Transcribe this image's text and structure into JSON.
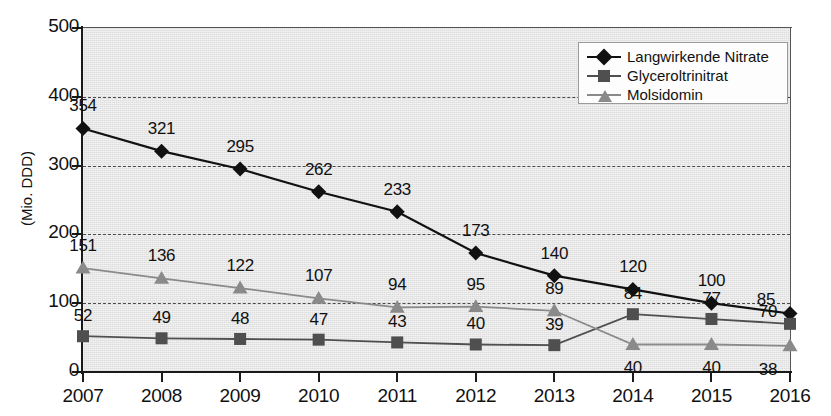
{
  "chart_data": {
    "type": "line",
    "title": "",
    "xlabel": "",
    "ylabel": "(Mio. DDD)",
    "x": [
      "2007",
      "2008",
      "2009",
      "2010",
      "2011",
      "2012",
      "2013",
      "2014",
      "2015",
      "2016"
    ],
    "categories": [
      "2007",
      "2008",
      "2009",
      "2010",
      "2011",
      "2012",
      "2013",
      "2014",
      "2015",
      "2016"
    ],
    "ylim": [
      0,
      500
    ],
    "yticks": [
      0,
      100,
      200,
      300,
      400,
      500
    ],
    "ytick_labels": [
      "0",
      "100",
      "200",
      "300",
      "400",
      "500"
    ],
    "grid": "horizontal-dashed",
    "legend_position": "top-right",
    "series": [
      {
        "name": "Langwirkende Nitrate",
        "marker": "diamond",
        "color": "#111111",
        "values": [
          354,
          321,
          295,
          262,
          233,
          173,
          140,
          120,
          100,
          85
        ],
        "labels": [
          "354",
          "321",
          "295",
          "262",
          "233",
          "173",
          "140",
          "120",
          "100",
          "85"
        ]
      },
      {
        "name": "Glyceroltrinitrat",
        "marker": "square",
        "color": "#4f4f4f",
        "values": [
          52,
          49,
          48,
          47,
          43,
          40,
          39,
          84,
          77,
          70
        ],
        "labels": [
          "52",
          "49",
          "48",
          "47",
          "43",
          "40",
          "39",
          "84",
          "77",
          "70"
        ]
      },
      {
        "name": "Molsidomin",
        "marker": "triangle",
        "color": "#8a8a8a",
        "values": [
          151,
          136,
          122,
          107,
          94,
          95,
          89,
          40,
          40,
          38
        ],
        "labels": [
          "151",
          "136",
          "122",
          "107",
          "94",
          "95",
          "89",
          "40",
          "40",
          "38"
        ]
      }
    ]
  },
  "legend": {
    "items": [
      {
        "label": "Langwirkende Nitrate",
        "marker": "diamond",
        "color": "#111111"
      },
      {
        "label": "Glyceroltrinitrat",
        "marker": "square",
        "color": "#4f4f4f"
      },
      {
        "label": "Molsidomin",
        "marker": "triangle",
        "color": "#8a8a8a"
      }
    ]
  },
  "axis": {
    "y_title": "(Mio. DDD)",
    "y_labels": [
      "500",
      "400",
      "300",
      "200",
      "100",
      "0"
    ],
    "x_labels": [
      "2007",
      "2008",
      "2009",
      "2010",
      "2011",
      "2012",
      "2013",
      "2014",
      "2015",
      "2016"
    ]
  },
  "colors": {
    "panel": "#e7e7e7",
    "axis": "#1a1a1a",
    "grid": "#4a4a4a",
    "series_1": "#111111",
    "series_2": "#4f4f4f",
    "series_3": "#8a8a8a"
  }
}
